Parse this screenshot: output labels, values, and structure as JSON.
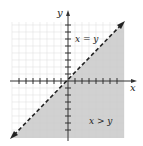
{
  "diagram": {
    "type": "inequality-region",
    "axes": {
      "x_label": "x",
      "y_label": "y"
    },
    "boundary": {
      "equation": "x = y",
      "style": "dashed",
      "label": "x = y"
    },
    "region": {
      "inequality": "x > y",
      "label": "x > y",
      "shaded": "below-right of line"
    },
    "ticks_per_half_axis": 8,
    "colors": {
      "shade": "#c9c9c9",
      "grid": "#e2e2e2",
      "axis": "#333333",
      "line": "#222222"
    }
  }
}
